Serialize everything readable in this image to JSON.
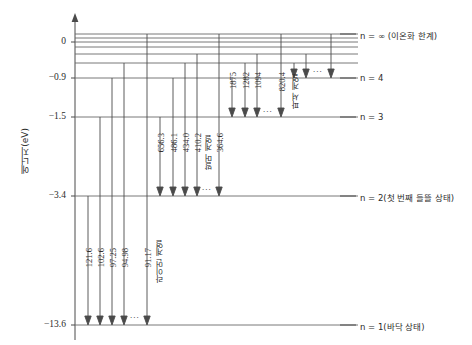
{
  "figure": {
    "type": "energy-level-diagram",
    "axis_title": "에너지(eV)",
    "y_ticks": [
      {
        "label": "0",
        "value": 0
      },
      {
        "label": "−0.9",
        "value": -0.9
      },
      {
        "label": "−1.5",
        "value": -1.5
      },
      {
        "label": "−3.4",
        "value": -3.4
      },
      {
        "label": "−13.6",
        "value": -13.6
      }
    ],
    "levels": [
      {
        "id": "inf",
        "label": "n = ∞ (이온화 한계)",
        "n": "∞",
        "energy": 0
      },
      {
        "id": "n4",
        "label": "n = 4",
        "n": "4",
        "energy": -0.9
      },
      {
        "id": "n3",
        "label": "n = 3",
        "n": "3",
        "energy": -1.5
      },
      {
        "id": "n2",
        "label": "n = 2(첫 번째 들뜰 상태)",
        "n": "2",
        "energy": -3.4
      },
      {
        "id": "n1",
        "label": "n = 1(바닥 상태)",
        "n": "1",
        "energy": -13.6
      }
    ],
    "series": [
      {
        "name": "라이먼 계열",
        "id": "lyman",
        "to_level": "n1",
        "wavelengths": [
          "121.6",
          "102.6",
          "97.25",
          "94.98",
          "91.17"
        ],
        "ellipsis": "..."
      },
      {
        "name": "발머 계열",
        "id": "balmer",
        "to_level": "n2",
        "wavelengths": [
          "656.3",
          "486.1",
          "434.0",
          "410.2",
          "364.6"
        ],
        "ellipsis": "..."
      },
      {
        "name": "파셔 계열",
        "id": "paschen",
        "to_level": "n3",
        "wavelengths": [
          "1875",
          "1282",
          "1094",
          "820.4"
        ],
        "ellipsis": "..."
      },
      {
        "name": "",
        "id": "brackett",
        "to_level": "n4",
        "wavelengths": [],
        "ellipsis": "..."
      }
    ],
    "units_note": "nm",
    "colors": {
      "line": "#4a4a4a",
      "text": "#2b2b2b",
      "background": "#ffffff"
    }
  }
}
